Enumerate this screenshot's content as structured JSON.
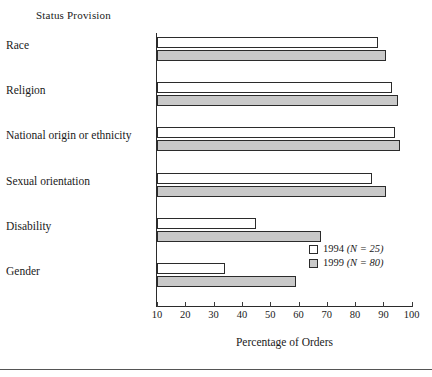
{
  "chart_data": {
    "type": "bar",
    "orientation": "horizontal",
    "title": "Status Provision",
    "xlabel": "Percentage of Orders",
    "ylabel": "",
    "xlim": [
      10,
      100
    ],
    "xticks": [
      10,
      20,
      30,
      40,
      50,
      60,
      70,
      80,
      90,
      100
    ],
    "grid": false,
    "legend_position": "inside-lower-right",
    "categories": [
      "Race",
      "Religion",
      "National origin or ethnicity",
      "Sexual orientation",
      "Disability",
      "Gender"
    ],
    "series": [
      {
        "name": "1994 (N = 25)",
        "year": "1994",
        "n_label": "(N = 25)",
        "color": "#ffffff",
        "values": [
          88,
          93,
          94,
          86,
          45,
          34
        ]
      },
      {
        "name": "1999 (N = 80)",
        "year": "1999",
        "n_label": "(N = 80)",
        "color": "#c9c9c9",
        "values": [
          91,
          95,
          96,
          91,
          68,
          59
        ]
      }
    ]
  },
  "axis": {
    "tick_labels": [
      "10",
      "20",
      "30",
      "40",
      "50",
      "60",
      "70",
      "80",
      "90",
      "100"
    ],
    "x_axis_title": "Percentage of Orders"
  },
  "legend": {
    "items": [
      {
        "label": "1994 (N = 25)",
        "year": "1994",
        "n": "(N = 25)"
      },
      {
        "label": "1999 (N = 80)",
        "year": "1999",
        "n": "(N = 80)"
      }
    ]
  },
  "title": "Status Provision"
}
